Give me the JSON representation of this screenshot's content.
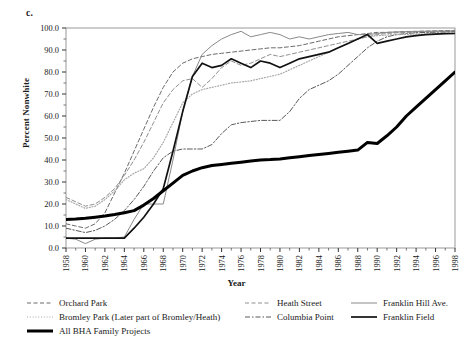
{
  "panel": {
    "label": "c."
  },
  "axes": {
    "ylabel": "Percent Nonwhite",
    "xlabel": "Year",
    "yticks": [
      "0.0",
      "10.0",
      "20.0",
      "30.0",
      "40.0",
      "50.0",
      "60.0",
      "70.0",
      "80.0",
      "90.0",
      "100.0"
    ],
    "xticks": [
      "1958",
      "1960",
      "1962",
      "1964",
      "1966",
      "1968",
      "1970",
      "1972",
      "1974",
      "1976",
      "1978",
      "1980",
      "1982",
      "1984",
      "1986",
      "1988",
      "1990",
      "1992",
      "1994",
      "1996",
      "1998"
    ]
  },
  "legend": {
    "left": [
      {
        "label": "Orchard Park",
        "style": "dashed",
        "color": "#6b6b6b",
        "width": 1
      },
      {
        "label": "Bromley Park (Later part of Bromley/Heath)",
        "style": "dotted",
        "color": "#a8a8a8",
        "width": 1
      },
      {
        "label": "All BHA Family Projects",
        "style": "solid",
        "color": "#000000",
        "width": 3
      }
    ],
    "mid": [
      {
        "label": "Heath Street",
        "style": "dashed",
        "color": "#8f8f8f",
        "width": 1
      },
      {
        "label": "Columbia Point",
        "style": "dashdot",
        "color": "#5a5a5a",
        "width": 1
      }
    ],
    "right": [
      {
        "label": "Franklin Hill Ave.",
        "style": "solid",
        "color": "#8a8a8a",
        "width": 1
      },
      {
        "label": "Franklin Field",
        "style": "solid",
        "color": "#111111",
        "width": 1.7
      }
    ]
  },
  "chart_data": {
    "type": "line",
    "title": "",
    "xlabel": "Year",
    "ylabel": "Percent Nonwhite",
    "xlim": [
      1958,
      1998
    ],
    "ylim": [
      0.0,
      100.0
    ],
    "grid": false,
    "legend_position": "below",
    "x": [
      1958,
      1959,
      1960,
      1961,
      1962,
      1963,
      1964,
      1965,
      1966,
      1967,
      1968,
      1969,
      1970,
      1971,
      1972,
      1973,
      1974,
      1975,
      1976,
      1977,
      1978,
      1979,
      1980,
      1981,
      1982,
      1983,
      1984,
      1985,
      1986,
      1987,
      1988,
      1989,
      1990,
      1991,
      1992,
      1993,
      1994,
      1995,
      1996,
      1997,
      1998
    ],
    "series": [
      {
        "name": "Orchard Park",
        "style": "dashed",
        "color": "#6b6b6b",
        "width": 1,
        "values": [
          11.0,
          10.0,
          9.0,
          11.0,
          16.0,
          25.0,
          34.0,
          44.0,
          54.0,
          64.0,
          73.0,
          80.0,
          84.0,
          86.0,
          87.0,
          88.0,
          88.5,
          89.0,
          89.5,
          90.0,
          90.5,
          91.0,
          91.0,
          91.5,
          92.0,
          93.0,
          94.0,
          95.0,
          96.0,
          96.5,
          97.0,
          97.5,
          98.0,
          98.0,
          98.2,
          98.4,
          98.5,
          98.6,
          98.7,
          98.8,
          98.9
        ]
      },
      {
        "name": "Bromley Park (Later part of Bromley/Heath)",
        "style": "dotted",
        "color": "#a8a8a8",
        "width": 1.2,
        "values": [
          22.0,
          20.0,
          18.0,
          19.0,
          22.0,
          26.0,
          31.0,
          34.0,
          36.0,
          41.0,
          48.0,
          57.0,
          66.0,
          70.0,
          72.0,
          73.0,
          74.0,
          75.0,
          75.5,
          76.0,
          77.0,
          78.0,
          79.0,
          81.0,
          83.0,
          85.0,
          87.0,
          89.0,
          91.0,
          93.0,
          95.0,
          96.0,
          96.5,
          96.8,
          97.0,
          97.1,
          97.2,
          97.3,
          97.4,
          97.4,
          97.5
        ]
      },
      {
        "name": "All BHA Family Projects",
        "style": "solid",
        "color": "#000000",
        "width": 3,
        "values": [
          13.0,
          13.2,
          13.5,
          14.0,
          14.5,
          15.2,
          16.0,
          17.0,
          19.5,
          22.5,
          26.0,
          29.5,
          33.0,
          35.0,
          36.5,
          37.5,
          38.0,
          38.5,
          39.0,
          39.5,
          40.0,
          40.2,
          40.5,
          41.0,
          41.5,
          42.0,
          42.5,
          43.0,
          43.5,
          44.0,
          44.5,
          48.0,
          47.5,
          51.0,
          55.0,
          60.0,
          64.0,
          68.0,
          72.0,
          76.0,
          80.0
        ]
      },
      {
        "name": "Heath Street",
        "style": "dashed",
        "color": "#8f8f8f",
        "width": 1,
        "values": [
          23.0,
          21.0,
          19.0,
          20.0,
          23.0,
          27.0,
          33.0,
          40.0,
          48.0,
          57.0,
          66.0,
          72.0,
          76.0,
          77.0,
          73.0,
          77.0,
          82.0,
          85.0,
          83.0,
          84.0,
          86.0,
          88.0,
          87.0,
          88.0,
          89.0,
          90.0,
          91.0,
          92.0,
          93.0,
          94.0,
          95.0,
          96.0,
          97.0,
          97.5,
          97.8,
          98.0,
          98.1,
          98.2,
          98.3,
          98.4,
          98.5
        ]
      },
      {
        "name": "Columbia Point",
        "style": "dashdot",
        "color": "#5a5a5a",
        "width": 1,
        "values": [
          9.0,
          8.0,
          7.0,
          8.0,
          10.0,
          13.0,
          17.0,
          22.0,
          28.0,
          35.0,
          41.0,
          44.0,
          45.0,
          45.0,
          45.0,
          47.0,
          52.0,
          56.0,
          57.0,
          57.5,
          58.0,
          58.0,
          58.0,
          62.0,
          68.0,
          72.0,
          74.0,
          76.0,
          79.0,
          83.0,
          87.0,
          91.0,
          94.0,
          96.0,
          97.0,
          97.5,
          97.8,
          98.0,
          98.1,
          98.2,
          98.3
        ]
      },
      {
        "name": "Franklin Hill Ave.",
        "style": "solid",
        "color": "#8a8a8a",
        "width": 1,
        "values": [
          4.5,
          4.0,
          2.0,
          4.0,
          4.5,
          4.5,
          5.0,
          13.0,
          20.0,
          20.0,
          20.0,
          40.0,
          62.0,
          78.0,
          88.0,
          92.0,
          95.0,
          97.0,
          98.5,
          96.0,
          97.0,
          98.0,
          97.0,
          95.0,
          96.0,
          95.0,
          96.0,
          97.0,
          97.5,
          98.0,
          97.0,
          97.0,
          97.5,
          98.0,
          98.2,
          98.3,
          98.4,
          98.5,
          98.6,
          98.6,
          98.7
        ]
      },
      {
        "name": "Franklin Field",
        "style": "solid",
        "color": "#111111",
        "width": 1.7,
        "values": [
          4.5,
          4.5,
          4.5,
          4.5,
          4.5,
          4.5,
          4.5,
          9.0,
          14.0,
          20.0,
          27.0,
          44.0,
          62.0,
          78.0,
          84.0,
          82.0,
          83.0,
          86.0,
          84.0,
          82.0,
          85.0,
          84.0,
          82.0,
          84.0,
          86.0,
          87.0,
          88.0,
          89.0,
          91.0,
          93.0,
          95.0,
          97.0,
          93.0,
          94.0,
          95.0,
          96.0,
          96.5,
          97.0,
          97.2,
          97.4,
          97.5
        ]
      }
    ]
  }
}
